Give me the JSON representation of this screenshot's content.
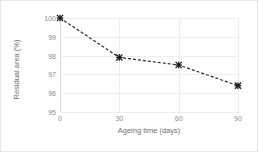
{
  "chart_data": {
    "type": "line",
    "title": "",
    "xlabel": "Ageing time (days)",
    "ylabel": "Residual area (%)",
    "x": [
      0,
      30,
      60,
      90
    ],
    "values": [
      100,
      97.9,
      97.5,
      96.4
    ],
    "series": [
      {
        "name": "Residual area",
        "x": [
          0,
          30,
          60,
          90
        ],
        "values": [
          100,
          97.9,
          97.5,
          96.4
        ]
      }
    ],
    "xlim": [
      0,
      90
    ],
    "ylim": [
      95,
      100
    ],
    "xticks": [
      0,
      30,
      60,
      90
    ],
    "xtick_labels": [
      "0",
      "30",
      "60",
      "90"
    ],
    "yticks": [
      95,
      96,
      97,
      98,
      99,
      100
    ],
    "ytick_labels": [
      "95",
      "96",
      "97",
      "98",
      "99",
      "100"
    ],
    "grid": true,
    "grid_axis": "both",
    "legend": false,
    "legend_position": "none",
    "line_style": "dashed",
    "line_color": "#2b2b2b",
    "marker": "x-asterisk",
    "marker_color": "#1a1a1a",
    "grid_color": "#ededed",
    "axis_color": "#d6d6d6",
    "tick_label_color": "#8c8c8c",
    "axis_title_color": "#6f6f6f",
    "background_color": "#ffffff",
    "border_color": "#e8e8e8"
  }
}
